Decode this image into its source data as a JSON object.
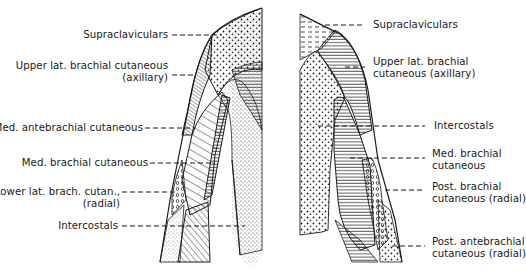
{
  "figure": {
    "left_view": {
      "name": "anterior arm",
      "labels": [
        {
          "id": "supraclaviculars",
          "lines": [
            "Supraclaviculars"
          ]
        },
        {
          "id": "upper-lat-brachial-cutaneous",
          "lines": [
            "Upper lat. brachial cutaneous",
            "(axillary)"
          ]
        },
        {
          "id": "med-antebrachial-cutaneous",
          "lines": [
            "Med. antebrachial cutaneous"
          ]
        },
        {
          "id": "med-brachial-cutaneous",
          "lines": [
            "Med. brachial cutaneous"
          ]
        },
        {
          "id": "lower-lat-brach-cutan",
          "lines": [
            "Lower lat. brach. cutan.,",
            "(radial)"
          ]
        },
        {
          "id": "intercostals",
          "lines": [
            "Intercostals"
          ]
        }
      ]
    },
    "right_view": {
      "name": "posterior arm",
      "labels": [
        {
          "id": "supraclaviculars",
          "lines": [
            "Supraclaviculars"
          ]
        },
        {
          "id": "upper-lat-brachial-cutaneous",
          "lines": [
            "Upper lat. brachial",
            "cutaneous (axillary)"
          ]
        },
        {
          "id": "intercostals",
          "lines": [
            "Intercostals"
          ]
        },
        {
          "id": "med-brachial-cutaneous",
          "lines": [
            "Med. brachial",
            "cutaneous"
          ]
        },
        {
          "id": "post-brachial-cutaneous",
          "lines": [
            "Post. brachial",
            "cutaneous (radial)"
          ]
        },
        {
          "id": "post-antebrachial-cutaneous",
          "lines": [
            "Post. antebrachial",
            "cutaneous (radial)"
          ]
        }
      ]
    }
  },
  "colors": {
    "ink": "#1a1a1a",
    "background": "#ffffff"
  }
}
